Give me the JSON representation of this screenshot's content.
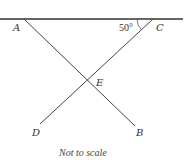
{
  "diagram": {
    "type": "geometry",
    "stroke_color": "#333333",
    "points": {
      "A": {
        "label": "A",
        "x": 24,
        "y": 19
      },
      "C": {
        "label": "C",
        "x": 153,
        "y": 19
      },
      "E": {
        "label": "E",
        "x": 87,
        "y": 82
      },
      "D": {
        "label": "D",
        "x": 40,
        "y": 124
      },
      "B": {
        "label": "B",
        "x": 135,
        "y": 126
      }
    },
    "segments": [
      {
        "from": "line-left",
        "to": "line-right"
      },
      {
        "from": "A",
        "to": "B"
      },
      {
        "from": "C",
        "to": "D"
      }
    ],
    "angle": {
      "vertex": "C",
      "value": "50°"
    },
    "note": "Not to scale"
  }
}
